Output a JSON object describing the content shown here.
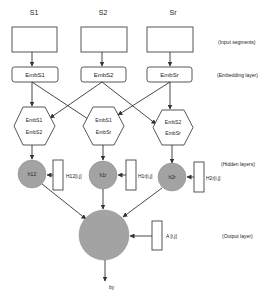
{
  "diagram": {
    "inputs": [
      {
        "label": "S1"
      },
      {
        "label": "S2"
      },
      {
        "label": "Sr"
      }
    ],
    "embeddings": [
      {
        "label": "EmbS1"
      },
      {
        "label": "EmbS2"
      },
      {
        "label": "EmbSr"
      }
    ],
    "combinations": [
      {
        "top": "EmbS1",
        "bottom": "EmbS2"
      },
      {
        "top": "EmbS1",
        "bottom": "EmbSr"
      },
      {
        "top": "EmbS2",
        "bottom": "EmbSr"
      }
    ],
    "hidden_nodes": [
      {
        "label": "h12",
        "weight": "H12[i,j]"
      },
      {
        "label": "h1r",
        "weight": "H1r[i,j]"
      },
      {
        "label": "h2r",
        "weight": "H2r[i,j]"
      }
    ],
    "output": {
      "weight": "A [i,j]",
      "label": "by"
    },
    "layer_labels": {
      "input": "(Input segments)",
      "embedding": "(Embedding layer)",
      "hidden": "(Hidden layers)",
      "output": "(Output layer)"
    },
    "colors": {
      "node_fill": "#a3a3a3",
      "stroke": "#333333"
    }
  }
}
